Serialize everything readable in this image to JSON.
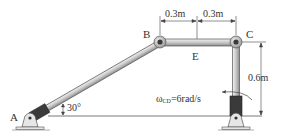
{
  "diagram": {
    "type": "four-bar linkage mechanism",
    "points": {
      "A": "A",
      "B": "B",
      "C": "C",
      "E": "E"
    },
    "dimensions": {
      "BE": "0.3m",
      "EC": "0.3m",
      "CD_height": "0.6m"
    },
    "angle_label": "30°",
    "angular_velocity": {
      "symbol": "ω",
      "subscript": "CD",
      "value": "=6rad/s"
    },
    "colors": {
      "link_fill": "#d9d9d9",
      "link_stroke": "#555555",
      "sleeve": "#3a3a3a",
      "text": "#333333"
    }
  }
}
